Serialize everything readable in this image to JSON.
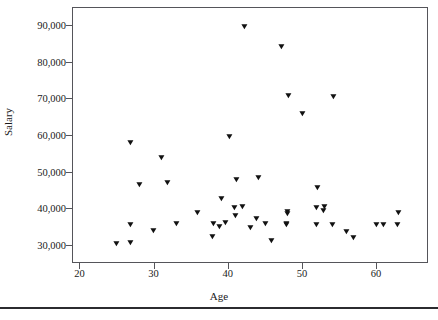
{
  "chart_data": {
    "type": "scatter",
    "title": "",
    "xlabel": "Age",
    "ylabel": "Salary",
    "xlim": [
      19,
      67
    ],
    "ylim": [
      25000,
      95000
    ],
    "xticks": [
      20,
      30,
      40,
      50,
      60
    ],
    "xtick_labels": [
      "20",
      "30",
      "40",
      "50",
      "60"
    ],
    "yticks": [
      30000,
      40000,
      50000,
      60000,
      70000,
      80000,
      90000
    ],
    "ytick_labels": [
      "30,000",
      "40,000",
      "50,000",
      "60,000",
      "70,000",
      "80,000",
      "90,000"
    ],
    "grid": false,
    "legend": false,
    "marker": "triangle-down",
    "marker_color": "#111111",
    "points": [
      {
        "x": 25.0,
        "y": 30300
      },
      {
        "x": 27.0,
        "y": 30350
      },
      {
        "x": 27.0,
        "y": 35500
      },
      {
        "x": 27.0,
        "y": 57800
      },
      {
        "x": 28.2,
        "y": 46300
      },
      {
        "x": 30.1,
        "y": 33700
      },
      {
        "x": 31.2,
        "y": 53800
      },
      {
        "x": 32.0,
        "y": 47000
      },
      {
        "x": 33.1,
        "y": 35700
      },
      {
        "x": 36.0,
        "y": 38700
      },
      {
        "x": 38.0,
        "y": 32000
      },
      {
        "x": 38.1,
        "y": 35600
      },
      {
        "x": 39.0,
        "y": 34800
      },
      {
        "x": 39.2,
        "y": 42400
      },
      {
        "x": 39.8,
        "y": 35900
      },
      {
        "x": 40.3,
        "y": 59500
      },
      {
        "x": 41.0,
        "y": 40000
      },
      {
        "x": 41.1,
        "y": 37900
      },
      {
        "x": 41.2,
        "y": 47800
      },
      {
        "x": 42.1,
        "y": 40400
      },
      {
        "x": 42.3,
        "y": 89500
      },
      {
        "x": 43.1,
        "y": 34700
      },
      {
        "x": 44.0,
        "y": 37000
      },
      {
        "x": 44.2,
        "y": 48300
      },
      {
        "x": 45.1,
        "y": 35600
      },
      {
        "x": 46.0,
        "y": 31000
      },
      {
        "x": 47.3,
        "y": 84000
      },
      {
        "x": 48.0,
        "y": 35400
      },
      {
        "x": 48.0,
        "y": 35700
      },
      {
        "x": 48.1,
        "y": 38300
      },
      {
        "x": 48.1,
        "y": 39000
      },
      {
        "x": 48.2,
        "y": 70700
      },
      {
        "x": 50.2,
        "y": 65800
      },
      {
        "x": 52.0,
        "y": 35400
      },
      {
        "x": 52.1,
        "y": 40100
      },
      {
        "x": 52.2,
        "y": 45500
      },
      {
        "x": 53.0,
        "y": 39100
      },
      {
        "x": 53.1,
        "y": 40200
      },
      {
        "x": 54.2,
        "y": 35300
      },
      {
        "x": 54.3,
        "y": 70500
      },
      {
        "x": 56.1,
        "y": 33400
      },
      {
        "x": 57.0,
        "y": 31800
      },
      {
        "x": 60.1,
        "y": 35300
      },
      {
        "x": 61.0,
        "y": 35300
      },
      {
        "x": 63.0,
        "y": 35500
      },
      {
        "x": 63.1,
        "y": 38800
      }
    ]
  }
}
